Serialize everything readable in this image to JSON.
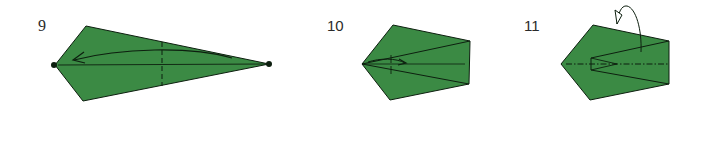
{
  "figure": {
    "colors": {
      "paper_fill": "#3b8a44",
      "line": "#0d1f0f",
      "background": "#ffffff"
    },
    "steps": [
      {
        "number": "9",
        "shape": "kite",
        "markings": [
          "center-line",
          "valley-fold-dashed-vertical",
          "curved-arrow-left",
          "reference-dot-left",
          "reference-dot-right"
        ]
      },
      {
        "number": "10",
        "shape": "pentagon",
        "markings": [
          "diagonal-fold-lines",
          "small-arrow-right",
          "tick-marks"
        ]
      },
      {
        "number": "11",
        "shape": "pentagon",
        "markings": [
          "mountain-fold-dash-dot-center",
          "inner-v-pocket",
          "curved-arrow-over-top"
        ]
      }
    ]
  }
}
